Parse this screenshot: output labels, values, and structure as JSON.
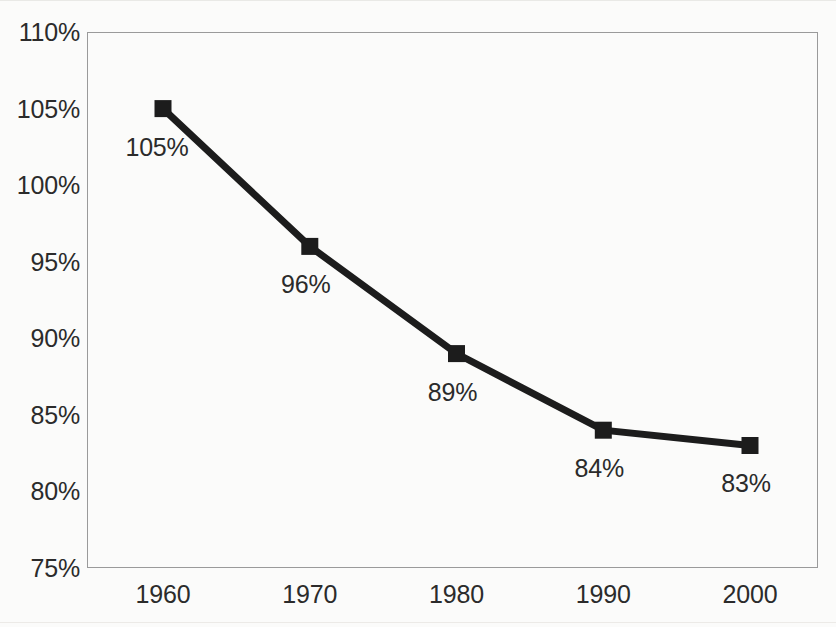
{
  "chart_data": {
    "type": "line",
    "title": "",
    "subtitle": "",
    "xlabel": "",
    "ylabel": "",
    "categories": [
      "1960",
      "1970",
      "1980",
      "1990",
      "2000"
    ],
    "values": [
      105,
      96,
      89,
      84,
      83
    ],
    "point_labels": [
      "105%",
      "96%",
      "89%",
      "84%",
      "83%"
    ],
    "ylim": [
      75,
      110
    ],
    "ytick_values": [
      110,
      105,
      100,
      95,
      90,
      85,
      80,
      75
    ],
    "ytick_labels": [
      "110%",
      "105%",
      "100%",
      "95%",
      "90%",
      "85%",
      "80%",
      "75%"
    ],
    "grid": false,
    "legend": null,
    "legend_position": "none",
    "series": [
      {
        "name": "",
        "values": [
          105,
          96,
          89,
          84,
          83
        ],
        "line_color": "#1c1c1c",
        "marker": "square",
        "marker_color": "#1c1c1c"
      }
    ],
    "colors": {
      "background": "#fbfbfa",
      "plot_border": "#9a9a9a",
      "text": "#2b2b2b",
      "series_line": "#1c1c1c",
      "marker": "#1c1c1c"
    }
  }
}
